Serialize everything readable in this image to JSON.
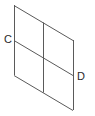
{
  "diagram": {
    "type": "parallelogram-grid",
    "labels": {
      "c": "C",
      "d": "D"
    },
    "line_color": "#5a5a5a",
    "points": {
      "top_left": [
        14,
        5
      ],
      "top_right": [
        73,
        40
      ],
      "bottom_left": [
        14,
        75
      ],
      "bottom_right": [
        73,
        110
      ],
      "C": [
        14,
        40
      ],
      "D": [
        73,
        75
      ],
      "top_mid": [
        43.5,
        22.5
      ],
      "bottom_mid": [
        43.5,
        92.5
      ]
    }
  }
}
